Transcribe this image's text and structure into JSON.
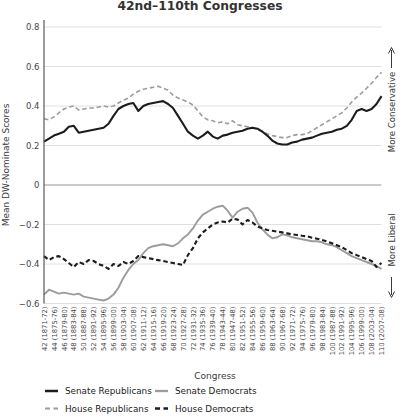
{
  "chart": {
    "title": "42nd–110th Congresses"
  },
  "colors": {
    "black_series": "#1c1c1c",
    "gray_series": "#9c9c9c",
    "gridline": "#dcdcdc",
    "zero_line": "#969696",
    "axis": "#4a4a4a",
    "text": "#3a3a3a"
  },
  "chart_data": {
    "type": "line",
    "title": "42nd–110th Congresses",
    "xlabel": "Congress",
    "ylabel": "Mean DW-Nominate Scores",
    "ylim": [
      -0.6,
      0.8
    ],
    "yticks": [
      0.8,
      0.6,
      0.4,
      0.2,
      0,
      -0.2,
      -0.4,
      -0.6
    ],
    "grid": "horizontal",
    "legend_position": "bottom",
    "x": [
      42,
      43,
      44,
      45,
      46,
      47,
      48,
      49,
      50,
      51,
      52,
      53,
      54,
      55,
      56,
      57,
      58,
      59,
      60,
      61,
      62,
      63,
      64,
      65,
      66,
      67,
      68,
      69,
      70,
      71,
      72,
      73,
      74,
      75,
      76,
      77,
      78,
      79,
      80,
      81,
      82,
      83,
      84,
      85,
      86,
      87,
      88,
      89,
      90,
      91,
      92,
      93,
      94,
      95,
      96,
      97,
      98,
      99,
      100,
      101,
      102,
      103,
      104,
      105,
      106,
      107,
      108,
      109,
      110
    ],
    "xtick_labels": [
      "42 (1871-72)",
      "44 (1875-76)",
      "46 (1879-80)",
      "48 (1883-84)",
      "50 (1887-88)",
      "52 (1891-92)",
      "54 (1895-96)",
      "56 (1899-00)",
      "58 (1903-04)",
      "60 (1907-08)",
      "62 (1911-12)",
      "64 (1915-16)",
      "66 (1919-20)",
      "68 (1923-24)",
      "70 (1927-28)",
      "72 (1931-32)",
      "74 (1935-36)",
      "76 (1939-40)",
      "78 (1943-44)",
      "80 (1947-48)",
      "82 (1951-52)",
      "84 (1955-56)",
      "86 (1959-60)",
      "88 (1963-64)",
      "90 (1967-68)",
      "92 (1971-72)",
      "94 (1975-76)",
      "96 (1979-80)",
      "98 (1983-84)",
      "100 (1987-88)",
      "102 (1991-92)",
      "104 (1995-96)",
      "106 (1999-00)",
      "108 (2003-04)",
      "110 (2007-08)"
    ],
    "series": [
      {
        "name": "Senate Republicans",
        "color": "#1c1c1c",
        "style": "solid",
        "width": 2.1,
        "values": [
          0.22,
          0.235,
          0.25,
          0.26,
          0.27,
          0.295,
          0.3,
          0.265,
          0.27,
          0.275,
          0.28,
          0.285,
          0.29,
          0.31,
          0.35,
          0.385,
          0.4,
          0.41,
          0.415,
          0.375,
          0.4,
          0.41,
          0.415,
          0.42,
          0.425,
          0.41,
          0.39,
          0.35,
          0.31,
          0.27,
          0.25,
          0.235,
          0.25,
          0.27,
          0.245,
          0.235,
          0.25,
          0.255,
          0.265,
          0.27,
          0.275,
          0.285,
          0.29,
          0.285,
          0.27,
          0.25,
          0.225,
          0.21,
          0.205,
          0.205,
          0.215,
          0.22,
          0.23,
          0.235,
          0.24,
          0.25,
          0.26,
          0.265,
          0.27,
          0.28,
          0.285,
          0.3,
          0.33,
          0.375,
          0.385,
          0.375,
          0.385,
          0.41,
          0.45
        ]
      },
      {
        "name": "Senate Democrats",
        "color": "#9c9c9c",
        "style": "solid",
        "width": 1.9,
        "values": [
          -0.555,
          -0.53,
          -0.54,
          -0.55,
          -0.545,
          -0.55,
          -0.555,
          -0.55,
          -0.565,
          -0.57,
          -0.575,
          -0.58,
          -0.585,
          -0.575,
          -0.555,
          -0.52,
          -0.47,
          -0.43,
          -0.4,
          -0.38,
          -0.345,
          -0.32,
          -0.31,
          -0.305,
          -0.3,
          -0.305,
          -0.31,
          -0.295,
          -0.27,
          -0.25,
          -0.22,
          -0.18,
          -0.15,
          -0.135,
          -0.12,
          -0.11,
          -0.105,
          -0.13,
          -0.165,
          -0.135,
          -0.12,
          -0.115,
          -0.14,
          -0.19,
          -0.225,
          -0.25,
          -0.27,
          -0.265,
          -0.25,
          -0.255,
          -0.265,
          -0.27,
          -0.275,
          -0.28,
          -0.285,
          -0.285,
          -0.29,
          -0.3,
          -0.305,
          -0.315,
          -0.33,
          -0.345,
          -0.36,
          -0.37,
          -0.38,
          -0.39,
          -0.4,
          -0.41,
          -0.425
        ]
      },
      {
        "name": "House Republicans",
        "color": "#9c9c9c",
        "style": "dashed",
        "width": 1.6,
        "values": [
          0.335,
          0.33,
          0.345,
          0.365,
          0.385,
          0.395,
          0.4,
          0.38,
          0.385,
          0.39,
          0.39,
          0.395,
          0.4,
          0.395,
          0.4,
          0.415,
          0.43,
          0.44,
          0.46,
          0.475,
          0.485,
          0.49,
          0.495,
          0.5,
          0.49,
          0.48,
          0.455,
          0.44,
          0.43,
          0.42,
          0.405,
          0.375,
          0.345,
          0.33,
          0.325,
          0.315,
          0.32,
          0.31,
          0.325,
          0.305,
          0.3,
          0.295,
          0.29,
          0.28,
          0.27,
          0.26,
          0.25,
          0.245,
          0.24,
          0.24,
          0.25,
          0.255,
          0.255,
          0.26,
          0.275,
          0.29,
          0.305,
          0.32,
          0.335,
          0.35,
          0.365,
          0.39,
          0.42,
          0.445,
          0.465,
          0.49,
          0.515,
          0.545,
          0.57
        ]
      },
      {
        "name": "House Democrats",
        "color": "#1c1c1c",
        "style": "dashed",
        "width": 2.1,
        "values": [
          -0.36,
          -0.38,
          -0.365,
          -0.36,
          -0.375,
          -0.395,
          -0.415,
          -0.39,
          -0.4,
          -0.38,
          -0.385,
          -0.4,
          -0.41,
          -0.425,
          -0.4,
          -0.41,
          -0.39,
          -0.4,
          -0.385,
          -0.36,
          -0.365,
          -0.37,
          -0.375,
          -0.38,
          -0.385,
          -0.39,
          -0.395,
          -0.4,
          -0.405,
          -0.355,
          -0.32,
          -0.27,
          -0.24,
          -0.22,
          -0.2,
          -0.19,
          -0.185,
          -0.19,
          -0.17,
          -0.175,
          -0.2,
          -0.177,
          -0.19,
          -0.21,
          -0.22,
          -0.228,
          -0.232,
          -0.236,
          -0.24,
          -0.245,
          -0.25,
          -0.253,
          -0.257,
          -0.26,
          -0.267,
          -0.272,
          -0.278,
          -0.285,
          -0.295,
          -0.305,
          -0.315,
          -0.33,
          -0.345,
          -0.355,
          -0.365,
          -0.375,
          -0.385,
          -0.415,
          -0.395
        ]
      }
    ],
    "annotations": [
      {
        "text": "More Conservative",
        "arrow": "up"
      },
      {
        "text": "More Liberal",
        "arrow": "down"
      }
    ],
    "legend": {
      "items": [
        "Senate Republicans",
        "Senate Democrats",
        "House Republicans",
        "House Democrats"
      ]
    }
  }
}
